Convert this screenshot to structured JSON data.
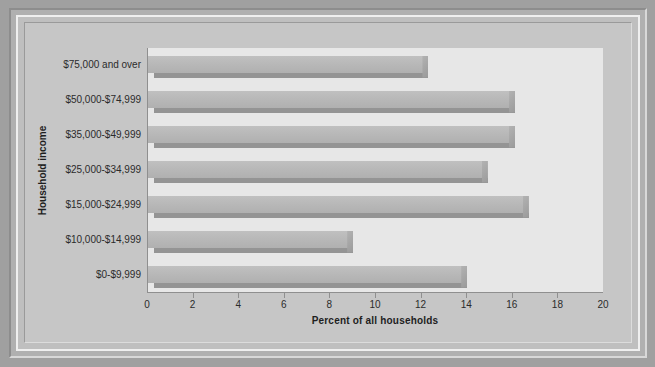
{
  "chart_data": {
    "type": "bar",
    "orientation": "horizontal",
    "title": "",
    "xlabel": "Percent of all households",
    "ylabel": "Household income",
    "categories": [
      "$75,000 and over",
      "$50,000-$74,999",
      "$35,000-$49,999",
      "$25,000-$34,999",
      "$15,000-$24,999",
      "$10,000-$14,999",
      "$0-$9,999"
    ],
    "values": [
      12.3,
      16.1,
      16.1,
      14.9,
      16.7,
      9.0,
      14.0
    ],
    "xlim": [
      0,
      20
    ],
    "ylim": null,
    "xticks": [
      0,
      2,
      4,
      6,
      8,
      10,
      12,
      14,
      16,
      18,
      20
    ],
    "xtick_labels": [
      "0",
      "2",
      "4",
      "6",
      "8",
      "10",
      "12",
      "14",
      "16",
      "18",
      "20"
    ],
    "grid": false,
    "legend": null,
    "bar_color": "#b6b6b6",
    "bar_shadow_color": "#949494",
    "plot_background": "#e7e7e7",
    "figure_background": "#c6c6c6"
  }
}
